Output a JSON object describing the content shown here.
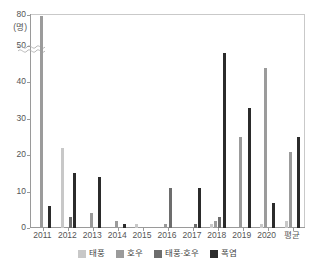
{
  "chart_data": {
    "type": "bar",
    "title": "",
    "xlabel": "",
    "ylabel": "(명)",
    "ylim": [
      0,
      80
    ],
    "grid": false,
    "axis_break": {
      "from": 50,
      "to": 75,
      "label": "axis-break"
    },
    "legend_position": "bottom-center",
    "y_ticks": [
      "80",
      "50",
      "40",
      "30",
      "20",
      "10",
      "0"
    ],
    "y_tick_values": [
      80,
      50,
      40,
      30,
      20,
      10,
      0
    ],
    "categories": [
      "2011",
      "2012",
      "2013",
      "2014",
      "2015",
      "2016",
      "2017",
      "2018",
      "2019",
      "2020",
      "평균"
    ],
    "series": [
      {
        "name": "태풍",
        "color": "#c8c8c8",
        "values": [
          0,
          22,
          0,
          0,
          1,
          0,
          0,
          1,
          0,
          1,
          2
        ]
      },
      {
        "name": "호우",
        "color": "#9b9b9b",
        "values": [
          78,
          0,
          4,
          2,
          0,
          1,
          0,
          2,
          25,
          44,
          21
        ]
      },
      {
        "name": "태풍·호우",
        "color": "#6d6d6d",
        "values": [
          0,
          3,
          0,
          0,
          0,
          11,
          1,
          3,
          0,
          0,
          0
        ]
      },
      {
        "name": "폭염",
        "color": "#2b2b2b",
        "values": [
          6,
          15,
          14,
          1,
          0,
          0,
          11,
          48,
          33,
          7,
          25
        ]
      }
    ]
  },
  "legend": {
    "items": [
      {
        "label": "태풍",
        "color": "#c8c8c8"
      },
      {
        "label": "호우",
        "color": "#9b9b9b"
      },
      {
        "label": "태풍·호우",
        "color": "#6d6d6d"
      },
      {
        "label": "폭염",
        "color": "#2b2b2b"
      }
    ]
  },
  "axis": {
    "y_unit": "(명)",
    "y_top": "80"
  }
}
